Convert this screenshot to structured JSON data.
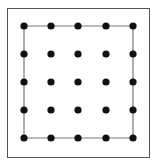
{
  "diagram": {
    "type": "geoboard-dot-grid",
    "frame": {
      "x": 7,
      "y": 8,
      "width": 142,
      "height": 149,
      "stroke": "#555555"
    },
    "grid": {
      "rows": 5,
      "cols": 5,
      "xs": [
        24,
        51,
        78,
        106,
        133
      ],
      "ys": [
        26,
        54,
        82,
        110,
        138
      ],
      "dot_radius": 3.6,
      "dot_color": "#111111"
    },
    "shape": {
      "name": "square",
      "vertices": [
        [
          0,
          0
        ],
        [
          4,
          0
        ],
        [
          4,
          4
        ],
        [
          0,
          4
        ]
      ],
      "stroke": "#777777"
    }
  }
}
